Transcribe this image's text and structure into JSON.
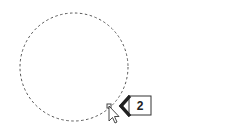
{
  "diagram": {
    "shape": "dashed-circle",
    "circle": {
      "cx": 74,
      "cy": 67,
      "r": 54,
      "stroke": "#555555",
      "dash": "2.5 2.5"
    },
    "handle": {
      "x": 107,
      "y": 104,
      "size": 4,
      "stroke": "#444444"
    },
    "callout": {
      "label": "2",
      "stroke": "#222222"
    },
    "cursor": "arrow-pointer"
  }
}
